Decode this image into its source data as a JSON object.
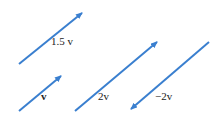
{
  "diagram": {
    "arrow_color": "#3a7fcf",
    "vectors": [
      {
        "id": "v15",
        "label": "1.5 v",
        "x1": 19,
        "y1": 64,
        "x2": 82,
        "y2": 13,
        "label_x": 51,
        "label_y": 36
      },
      {
        "id": "v1",
        "label": "v",
        "x1": 19,
        "y1": 111,
        "x2": 61,
        "y2": 76,
        "label_x": 41,
        "label_y": 91
      },
      {
        "id": "v2",
        "label": "2v",
        "x1": 75,
        "y1": 111,
        "x2": 157,
        "y2": 42,
        "label_x": 98,
        "label_y": 91
      },
      {
        "id": "vneg2",
        "label": "−2v",
        "x1": 209,
        "y1": 42,
        "x2": 131,
        "y2": 109,
        "label_x": 155,
        "label_y": 91
      }
    ]
  }
}
